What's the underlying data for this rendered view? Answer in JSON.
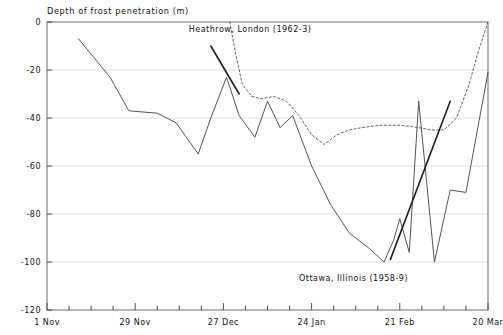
{
  "chart_data": {
    "type": "line",
    "title": "Depth of frost penetration (m)",
    "xlabel": "",
    "ylabel": "Depth of frost penetration (m)",
    "ylim": [
      -120,
      0
    ],
    "yticks": [
      0,
      -20,
      -40,
      -60,
      -80,
      -100,
      -120
    ],
    "ytick_labels": [
      "0",
      "-20",
      "-40",
      "-60",
      "-80",
      "-100",
      "-120"
    ],
    "xlim": [
      0,
      140
    ],
    "xticks": [
      0,
      28,
      56,
      84,
      112,
      140
    ],
    "xtick_labels": [
      "1 Nov",
      "29 Nov",
      "27 Dec",
      "24 Jan",
      "21 Feb",
      "20 Mar"
    ],
    "xminor_step_days": 7,
    "grid": true,
    "grid_axis": "y",
    "legend": "none",
    "annotations": [
      {
        "name": "heathrow-label",
        "text": "Heathrow, London (1962-3)",
        "x_day": 45,
        "y_value": -4,
        "leader_from_day": 52,
        "leader_from_value": -10,
        "leader_to_day": 61,
        "leader_to_value": -30
      },
      {
        "name": "ottawa-label",
        "text": "Ottawa, Illinois (1958-9)",
        "x_day": 80,
        "y_value": -108,
        "leader_from_day": 109,
        "leader_from_value": -99,
        "leader_to_day": 128,
        "leader_to_value": -33
      }
    ],
    "series": [
      {
        "name": "Ottawa, Illinois (1958-9)",
        "style": "solid",
        "color": "#4a4a4a",
        "x": [
          10,
          20,
          26,
          35,
          41,
          48,
          52,
          57,
          61,
          66,
          70,
          74,
          78,
          84,
          90,
          96,
          102,
          107,
          110,
          112,
          115,
          118,
          123,
          128,
          133,
          140
        ],
        "y": [
          -7,
          -23,
          -37,
          -38,
          -42,
          -55,
          -40,
          -23,
          -39,
          -48,
          -33,
          -44,
          -39,
          -60,
          -76,
          -88,
          -94,
          -100,
          -91,
          -82,
          -96,
          -33,
          -100,
          -70,
          -71,
          -21
        ]
      },
      {
        "name": "Heathrow, London (1962-3)",
        "style": "dashed",
        "color": "#5a5a5a",
        "x": [
          58,
          60,
          62,
          65,
          68,
          72,
          76,
          80,
          84,
          88,
          92,
          96,
          100,
          106,
          112,
          118,
          122,
          126,
          130,
          134,
          137,
          140
        ],
        "y": [
          0,
          -14,
          -26,
          -31,
          -32,
          -31,
          -33,
          -39,
          -47,
          -51,
          -47,
          -45,
          -44,
          -43,
          -43,
          -44,
          -45,
          -45,
          -40,
          -26,
          -12,
          0
        ]
      }
    ]
  }
}
